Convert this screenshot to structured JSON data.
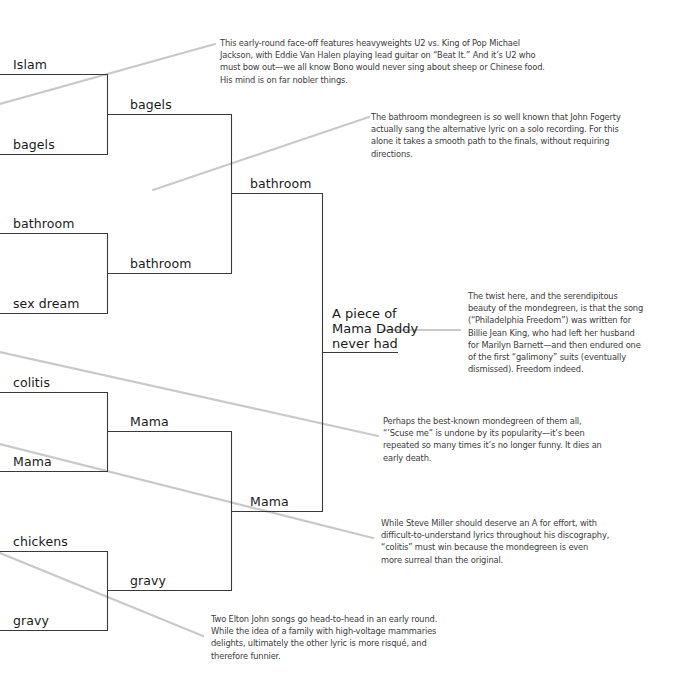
{
  "bracket": {
    "round1": [
      {
        "label": "Islam"
      },
      {
        "label": "bagels"
      },
      {
        "label": "bathroom"
      },
      {
        "label": "sex dream"
      },
      {
        "label": "colitis"
      },
      {
        "label": "Mama"
      },
      {
        "label": "chickens"
      },
      {
        "label": "gravy"
      }
    ],
    "round2": [
      {
        "label": "bagels"
      },
      {
        "label": "bathroom"
      },
      {
        "label": "Mama"
      },
      {
        "label": "gravy"
      }
    ],
    "round3": [
      {
        "label": "bathroom"
      },
      {
        "label": "Mama"
      }
    ],
    "champion": {
      "line1": "A piece of",
      "line2": "Mama Daddy",
      "line3": "never had"
    }
  },
  "annotations": [
    {
      "id": "u2-vs-jackson",
      "text": "This early-round face-off features heavyweights U2 vs. King of Pop Michael Jackson, with Eddie Van Halen playing lead guitar on “Beat It.” And it’s U2 who must bow out—we all know Bono would never sing about sheep or Chinese food. His mind is on far nobler things."
    },
    {
      "id": "bathroom-fogerty",
      "text": "The bathroom mondegreen is so well known that John Fogerty actually sang the alternative lyric on a solo recording. For this alone it takes a smooth path to the finals, without requiring directions."
    },
    {
      "id": "philadelphia-freedom",
      "text": "The twist here, and the serendipitous beauty of the mondegreen, is that the song (“Philadelphia Freedom”) was written for Billie Jean King, who had left her husband for Marilyn Barnett—and then endured one of the first “galimony” suits (eventually dismissed). Freedom indeed."
    },
    {
      "id": "scuse-me",
      "text": "Perhaps the best-known mondegreen of them all, “’Scuse me” is undone by its popularity—it’s been repeated so many times it’s no longer funny. It dies an early death."
    },
    {
      "id": "steve-miller",
      "text": "While Steve Miller should deserve an A for effort, with difficult-to-understand lyrics throughout his discography, “colitis” must win because the mondegreen is even more surreal than the original."
    },
    {
      "id": "elton-john",
      "text": "Two Elton John songs go head-to-head in an early round. While the idea of a family with high-voltage mammaries delights, ultimately the other lyric is more risqué, and therefore funnier."
    }
  ],
  "colors": {
    "bracket_line": "#3a3a3a",
    "connector_line": "#c8c8c8",
    "annotation_text": "#3c3c3c",
    "entry_text": "#1a1a1a",
    "background": "#ffffff"
  }
}
